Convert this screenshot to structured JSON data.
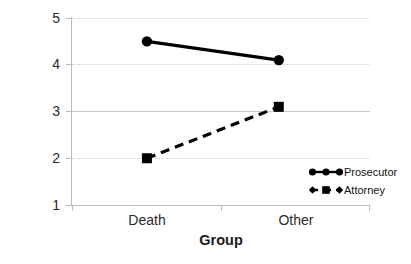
{
  "chart_data": {
    "type": "line",
    "title": "",
    "xlabel": "Group",
    "ylabel": "Rating as \"Convincing\"",
    "categories": [
      "Death",
      "Other"
    ],
    "ylim": [
      1,
      5
    ],
    "yticks": [
      "1",
      "2",
      "3",
      "4",
      "5"
    ],
    "grid": true,
    "legend_position": "inside-lower-right",
    "series": [
      {
        "name": "Prosecutor",
        "values": [
          4.5,
          4.1
        ],
        "line_style": "solid",
        "marker": "circle",
        "color": "#000000"
      },
      {
        "name": "Attorney",
        "values": [
          2.0,
          3.1
        ],
        "line_style": "dashed",
        "marker": "square",
        "color": "#000000"
      }
    ]
  },
  "axes": {
    "y_title": "Rating as \"Convincing\"",
    "x_title": "Group",
    "y_tick_5": "5",
    "y_tick_4": "4",
    "y_tick_3": "3",
    "y_tick_2": "2",
    "y_tick_1": "1",
    "x_tick_death": "Death",
    "x_tick_other": "Other"
  },
  "legend": {
    "prosecutor_label": "Prosecutor",
    "attorney_label": "Attorney"
  }
}
